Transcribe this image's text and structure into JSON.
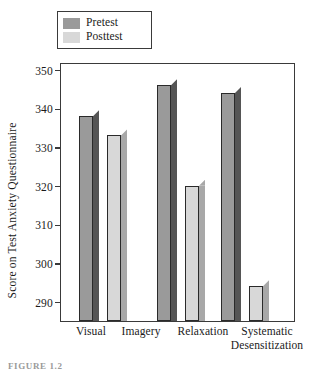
{
  "legend": {
    "entries": [
      {
        "label": "Pretest",
        "color": "#9a9a9a"
      },
      {
        "label": "Posttest",
        "color": "#d8d8d8"
      }
    ]
  },
  "axes": {
    "ylabel": "Score on Test Anxiety Questionnaire",
    "yticks": [
      "350",
      "340",
      "330",
      "320",
      "310",
      "300",
      "290"
    ],
    "xticks": [
      "Visual",
      "Imagery",
      "Relaxation",
      "Systematic",
      "Desensitization"
    ]
  },
  "caption": {
    "text": "FIGURE 1.2"
  },
  "colors": {
    "pretest_face": "#9a9a9a",
    "pretest_side": "#555555",
    "posttest_face": "#d8d8d8",
    "posttest_side": "#a8a8a8",
    "frame": "#3a3a3a",
    "outline": "#2a2a2a",
    "background": "#ffffff"
  },
  "chart_data": {
    "type": "bar",
    "title": "",
    "xlabel": "",
    "ylabel": "Score on Test Anxiety Questionnaire",
    "categories": [
      "Visual Imagery",
      "Relaxation",
      "Systematic Desensitization"
    ],
    "series": [
      {
        "name": "Pretest",
        "values": [
          338,
          346,
          344
        ]
      },
      {
        "name": "Posttest",
        "values": [
          333,
          320,
          294
        ]
      }
    ],
    "ylim": [
      285,
      352
    ],
    "ytick_values": [
      290,
      300,
      310,
      320,
      330,
      340,
      350
    ],
    "grid": false,
    "legend_position": "top-left-outside",
    "style": "3d-shaded-bars"
  }
}
